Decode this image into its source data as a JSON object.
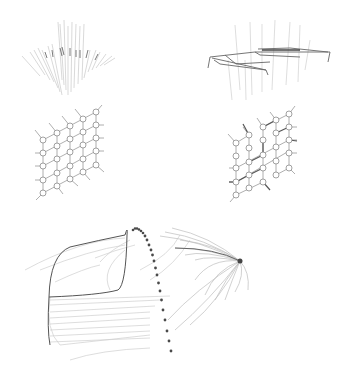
{
  "figure": {
    "panels": [
      {
        "id": "top-left",
        "kind": "streamline-fan",
        "description": "vertical fan of faint streamlines"
      },
      {
        "id": "top-right",
        "kind": "streamline-frame",
        "description": "streamlines forming a tilted rectangular frame"
      },
      {
        "id": "mid-left",
        "kind": "node-grid",
        "rows": 5,
        "cols": 5,
        "description": "regular skewed lattice of circular nodes with outward stubs"
      },
      {
        "id": "mid-right",
        "kind": "node-grid",
        "rows": 5,
        "cols": 5,
        "description": "deformed skewed lattice of circular nodes with bold bonds"
      },
      {
        "id": "bottom",
        "kind": "streamlines-with-dotted-path",
        "description": "streamline bundles converging to a point, with a dotted trajectory curve"
      }
    ],
    "colors": {
      "background": "#ffffff",
      "node_stroke": "#8a8a8a",
      "edge": "#9a9a9a",
      "bold_edge": "#555555",
      "streamline_light": "#c8c8c8",
      "streamline_dark": "#555555",
      "dot": "#4a4a4a"
    }
  }
}
